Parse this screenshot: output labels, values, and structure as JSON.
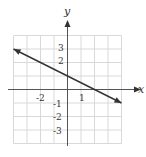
{
  "chart_data": {
    "type": "line",
    "title": "",
    "xlabel": "x",
    "ylabel": "y",
    "xlim": [
      -4,
      4
    ],
    "ylim": [
      -4,
      4
    ],
    "grid": true,
    "x_tick_labels": [
      "-2",
      "1"
    ],
    "y_tick_labels": [
      "3",
      "2",
      "-1",
      "-2",
      "-3"
    ],
    "series": [
      {
        "name": "line",
        "equation": "y = -x/2 + 1",
        "x": [
          -4,
          0,
          2,
          4
        ],
        "y": [
          3,
          1,
          0,
          -1
        ],
        "arrows_both_ends": true
      }
    ],
    "colors": {
      "grid": "#d9d9d9",
      "axis": "#555555",
      "line": "#333333"
    }
  }
}
